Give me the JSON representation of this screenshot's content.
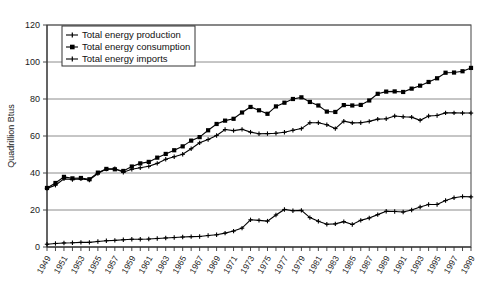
{
  "chart_data": {
    "type": "line",
    "title": "",
    "subtitle": "",
    "xlabel": "",
    "ylabel": "Quadrillion Btus",
    "ylim": [
      0,
      120
    ],
    "yticks": [
      0,
      20,
      40,
      60,
      80,
      100,
      120
    ],
    "ytick_labels": [
      "0",
      "20",
      "40",
      "60",
      "80",
      "100",
      "120"
    ],
    "grid": true,
    "grid_axis": "y",
    "legend_position": "top-left-inside",
    "x": [
      1949,
      1950,
      1951,
      1952,
      1953,
      1954,
      1955,
      1956,
      1957,
      1958,
      1959,
      1960,
      1961,
      1962,
      1963,
      1964,
      1965,
      1966,
      1967,
      1968,
      1969,
      1970,
      1971,
      1972,
      1973,
      1974,
      1975,
      1976,
      1977,
      1978,
      1979,
      1980,
      1981,
      1982,
      1983,
      1984,
      1985,
      1986,
      1987,
      1988,
      1989,
      1990,
      1991,
      1992,
      1993,
      1994,
      1995,
      1996,
      1997,
      1998,
      1999
    ],
    "xtick_labels": [
      "1949",
      "1951",
      "1953",
      "1955",
      "1957",
      "1959",
      "1961",
      "1963",
      "1965",
      "1967",
      "1969",
      "1971",
      "1973",
      "1975",
      "1977",
      "1979",
      "1981",
      "1983",
      "1985",
      "1987",
      "1989",
      "1991",
      "1993",
      "1995",
      "1997",
      "1999"
    ],
    "xtick_step": 2,
    "series": [
      {
        "name": "Total energy production",
        "marker": "plus",
        "color": "#000000",
        "values": [
          31.7,
          33.4,
          36.8,
          36.5,
          36.8,
          36.2,
          39.7,
          42.1,
          42.3,
          40.4,
          42.0,
          42.8,
          43.6,
          45.2,
          47.4,
          48.8,
          50.1,
          53.1,
          56.3,
          58.1,
          60.3,
          63.5,
          62.9,
          63.6,
          62.1,
          61.2,
          61.3,
          61.5,
          62.0,
          63.1,
          64.0,
          67.2,
          67.2,
          66.1,
          64.0,
          68.0,
          67.1,
          67.2,
          67.9,
          69.1,
          69.3,
          70.8,
          70.4,
          70.2,
          68.5,
          70.8,
          71.1,
          72.5,
          72.5,
          72.4,
          72.4
        ]
      },
      {
        "name": "Total energy consumption",
        "marker": "square",
        "color": "#000000",
        "values": [
          31.9,
          34.6,
          37.9,
          37.1,
          37.3,
          36.6,
          40.2,
          42.2,
          42.0,
          41.1,
          43.5,
          45.2,
          46.0,
          48.3,
          50.3,
          52.3,
          54.4,
          57.5,
          59.4,
          63.1,
          66.5,
          68.3,
          69.3,
          72.7,
          75.7,
          73.9,
          72.0,
          76.0,
          78.0,
          80.0,
          80.9,
          78.4,
          76.5,
          73.2,
          73.0,
          76.7,
          76.5,
          76.8,
          79.2,
          82.8,
          84.0,
          84.1,
          83.8,
          85.6,
          87.2,
          89.2,
          91.2,
          94.2,
          94.3,
          95.0,
          96.8
        ]
      },
      {
        "name": "Total energy imports",
        "marker": "plus",
        "color": "#000000",
        "values": [
          1.5,
          1.9,
          2.2,
          2.3,
          2.5,
          2.5,
          3.0,
          3.4,
          3.6,
          3.9,
          4.2,
          4.2,
          4.3,
          4.6,
          4.9,
          5.1,
          5.4,
          5.6,
          5.7,
          6.2,
          6.6,
          7.5,
          8.6,
          10.2,
          14.7,
          14.4,
          14.0,
          17.3,
          20.3,
          19.6,
          19.8,
          15.9,
          13.9,
          12.3,
          12.5,
          13.7,
          12.2,
          14.4,
          15.7,
          17.5,
          19.3,
          19.2,
          18.9,
          20.0,
          21.6,
          23.0,
          23.0,
          25.1,
          26.6,
          27.3,
          27.1
        ]
      }
    ]
  },
  "legend": {
    "entries": [
      {
        "label": "Total energy production",
        "marker": "plus-marker"
      },
      {
        "label": "Total energy consumption",
        "marker": "square-marker"
      },
      {
        "label": "Total energy imports",
        "marker": "plus-marker"
      }
    ]
  },
  "axis": {
    "y_title": "Quadrillion Btus"
  }
}
